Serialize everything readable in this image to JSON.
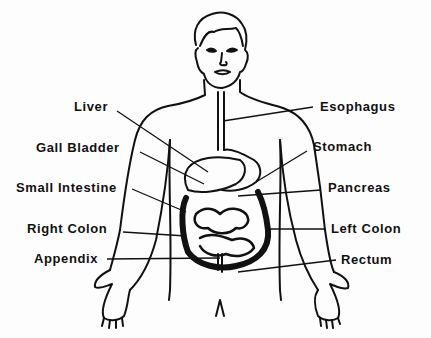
{
  "diagram": {
    "type": "anatomical-illustration",
    "line_color": "#111111",
    "background": "#fdfdfd",
    "labels_left": [
      {
        "id": "liver",
        "text": "Liver"
      },
      {
        "id": "gall-bladder",
        "text": "Gall Bladder"
      },
      {
        "id": "small-intestine",
        "text": "Small Intestine"
      },
      {
        "id": "right-colon",
        "text": "Right Colon"
      },
      {
        "id": "appendix",
        "text": "Appendix"
      }
    ],
    "labels_right": [
      {
        "id": "esophagus",
        "text": "Esophagus"
      },
      {
        "id": "stomach",
        "text": "Stomach"
      },
      {
        "id": "pancreas",
        "text": "Pancreas"
      },
      {
        "id": "left-colon",
        "text": "Left Colon"
      },
      {
        "id": "rectum",
        "text": "Rectum"
      }
    ]
  }
}
